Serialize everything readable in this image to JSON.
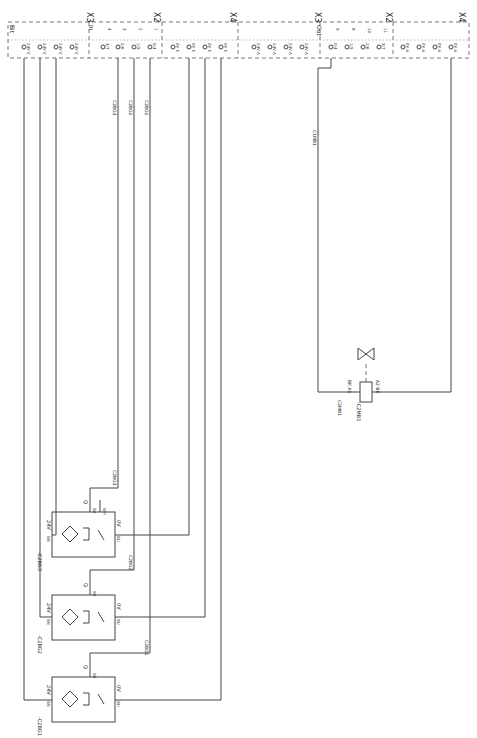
{
  "diagram": {
    "orientation": "rotated 90deg clockwise",
    "connector_groups": [
      {
        "label": "X3",
        "x": 90,
        "section": "Bit",
        "pins": [
          {
            "label": "24V E",
            "x": 24
          },
          {
            "label": "24V E",
            "x": 40
          },
          {
            "label": "24V E",
            "x": 56
          },
          {
            "label": "24V E",
            "x": 72
          }
        ]
      },
      {
        "label": "X2",
        "x": 157,
        "section": "In",
        "pins": [
          {
            "label": "3/7",
            "num": "4",
            "x": 103
          },
          {
            "label": "2/6",
            "num": "3",
            "x": 118
          },
          {
            "label": "1/5",
            "num": "2",
            "x": 134
          },
          {
            "label": "0/4",
            "num": "1",
            "x": 150
          }
        ]
      },
      {
        "label": "X4",
        "x": 233,
        "pins": [
          {
            "label": "0V E",
            "x": 173
          },
          {
            "label": "0V E",
            "x": 189
          },
          {
            "label": "0V E",
            "x": 205
          },
          {
            "label": "0V E",
            "x": 221
          }
        ]
      },
      {
        "label": "X3",
        "x": 318,
        "pins": [
          {
            "label": "24V A",
            "x": 254
          },
          {
            "label": "24V A",
            "x": 270
          },
          {
            "label": "24V A",
            "x": 286
          },
          {
            "label": "24V A",
            "x": 302
          }
        ]
      },
      {
        "label": "X2",
        "x": 389,
        "section": "Out",
        "pins": [
          {
            "label": "0/4",
            "num": "9",
            "x": 331
          },
          {
            "label": "1/5",
            "num": "8",
            "x": 347
          },
          {
            "label": "2/6",
            "num": "10",
            "x": 363
          },
          {
            "label": "3/7",
            "num": "11",
            "x": 379
          }
        ]
      },
      {
        "label": "X4",
        "x": 462,
        "pins": [
          {
            "label": "0V A",
            "x": 403
          },
          {
            "label": "0V A",
            "x": 419
          },
          {
            "label": "0V A",
            "x": 435
          },
          {
            "label": "0V A",
            "x": 451
          }
        ]
      }
    ],
    "wire_labels": [
      {
        "text": "C2BG3",
        "x": 118,
        "y": 100
      },
      {
        "text": "C2BG2",
        "x": 134,
        "y": 100
      },
      {
        "text": "C2BG1",
        "x": 150,
        "y": 100
      },
      {
        "text": "C1MB1",
        "x": 318,
        "y": 130
      },
      {
        "text": "C2BG3",
        "x": 118,
        "y": 470
      },
      {
        "text": "C2BG2",
        "x": 134,
        "y": 555
      },
      {
        "text": "C2BG1",
        "x": 150,
        "y": 640
      },
      {
        "text": "C2MB1",
        "x": 343,
        "y": 400
      }
    ],
    "sensors": [
      {
        "tag": "-C2BG3",
        "type": "inductive proximity with test input",
        "x": 75,
        "y": 490,
        "terminals": {
          "supply": "24V",
          "supply_pin": "BN",
          "out": "Q",
          "out_pin": "BK",
          "gnd": "0V",
          "gnd_pin": "BU",
          "test": "WH"
        }
      },
      {
        "tag": "-C2BG2",
        "type": "inductive proximity",
        "x": 75,
        "y": 573,
        "terminals": {
          "supply": "24V",
          "supply_pin": "BN",
          "out": "Q",
          "out_pin": "BK",
          "gnd": "0V",
          "gnd_pin": "BU"
        }
      },
      {
        "tag": "-C2BG1",
        "type": "inductive proximity",
        "x": 75,
        "y": 655,
        "terminals": {
          "supply": "24V",
          "supply_pin": "BN",
          "out": "Q",
          "out_pin": "BK",
          "gnd": "0V",
          "gnd_pin": "BU"
        }
      }
    ],
    "valve": {
      "tag": "-C2MB1",
      "pins": [
        {
          "label": "A1",
          "color": "BK"
        },
        {
          "label": "A2",
          "color": "BK"
        }
      ],
      "x": 366,
      "y": 392
    },
    "colors": {
      "line": "#444444",
      "text": "#222222",
      "background": "#ffffff"
    }
  }
}
